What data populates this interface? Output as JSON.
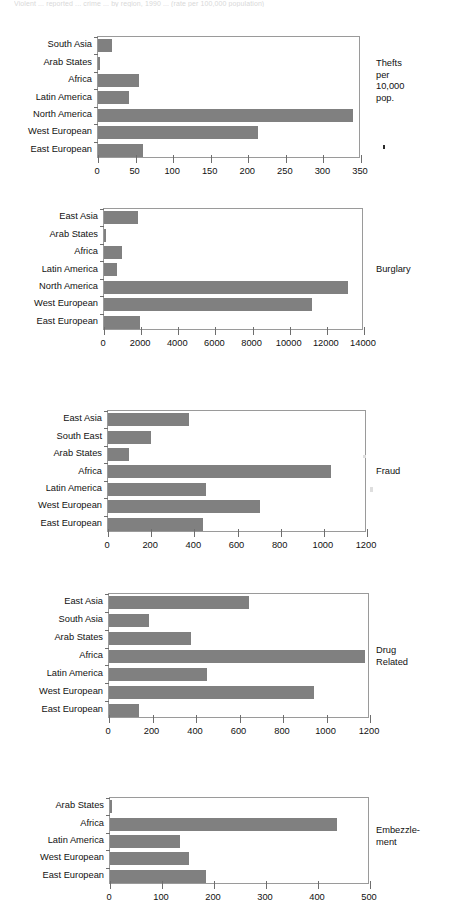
{
  "page": {
    "top_cropped_text": "Violent ... reported ... crime ... by region, 1990 ... (rate per 100,000 population)",
    "bar_color": "#808080",
    "axis_color": "#6e6e6e",
    "text_color": "#111111"
  },
  "chart_data": [
    {
      "type": "bar",
      "orientation": "horizontal",
      "title": "Thefts per 10,000 pop.",
      "side_label": "Thefts\nper\n10,000\npop.",
      "categories": [
        "South Asia",
        "Arab States",
        "Africa",
        "Latin America",
        "North America",
        "West European",
        "East European"
      ],
      "values": [
        18,
        1,
        55,
        41,
        339,
        213,
        60
      ],
      "xlabel": "",
      "ylabel": "",
      "xlim": [
        0,
        350
      ],
      "xticks": [
        0,
        50,
        100,
        150,
        200,
        250,
        300,
        350
      ],
      "xticklabels": [
        "0",
        "50",
        "100",
        "150",
        "200",
        "250",
        "300",
        "350"
      ],
      "grid": false,
      "legend": false
    },
    {
      "type": "bar",
      "orientation": "horizontal",
      "title": "Burglary",
      "side_label": "Burglary",
      "categories": [
        "East Asia",
        "Arab States",
        "Africa",
        "Latin America",
        "North America",
        "West European",
        "East European"
      ],
      "values": [
        1850,
        100,
        990,
        720,
        13150,
        11180,
        1920
      ],
      "xlabel": "",
      "ylabel": "",
      "xlim": [
        0,
        14000
      ],
      "xticks": [
        0,
        2000,
        4000,
        6000,
        8000,
        10000,
        12000,
        14000
      ],
      "xticklabels": [
        "0",
        "2000",
        "4000",
        "6000",
        "8000",
        "10000",
        "12000",
        "14000"
      ],
      "grid": false,
      "legend": false
    },
    {
      "type": "bar",
      "orientation": "horizontal",
      "title": "Fraud",
      "side_label": "Fraud",
      "categories": [
        "East Asia",
        "South East",
        "Arab States",
        "Africa",
        "Latin America",
        "West European",
        "East European"
      ],
      "values": [
        374,
        198,
        95,
        1035,
        453,
        703,
        441
      ],
      "xlabel": "",
      "ylabel": "",
      "xlim": [
        0,
        1200
      ],
      "xticks": [
        0,
        200,
        400,
        600,
        800,
        1000,
        1200
      ],
      "xticklabels": [
        "0",
        "200",
        "400",
        "600",
        "800",
        "1000",
        "1200"
      ],
      "grid": false,
      "legend": false
    },
    {
      "type": "bar",
      "orientation": "horizontal",
      "title": "Drug Related",
      "side_label": "Drug\nRelated",
      "categories": [
        "East Asia",
        "South Asia",
        "Arab States",
        "Africa",
        "Latin America",
        "West European",
        "East European"
      ],
      "values": [
        644,
        184,
        378,
        1177,
        449,
        943,
        138
      ],
      "xlabel": "",
      "ylabel": "",
      "xlim": [
        0,
        1200
      ],
      "xticks": [
        0,
        200,
        400,
        600,
        800,
        1000,
        1200
      ],
      "xticklabels": [
        "0",
        "200",
        "400",
        "600",
        "800",
        "1000",
        "1200"
      ],
      "grid": false,
      "legend": false
    },
    {
      "type": "bar",
      "orientation": "horizontal",
      "title": "Embezzlement",
      "side_label": "Embezzle-\nment",
      "categories": [
        "Arab States",
        "Africa",
        "Latin America",
        "West European",
        "East European"
      ],
      "values": [
        3,
        436,
        134,
        151,
        184
      ],
      "xlabel": "",
      "ylabel": "",
      "xlim": [
        0,
        500
      ],
      "xticks": [
        0,
        100,
        200,
        300,
        400,
        500
      ],
      "xticklabels": [
        "0",
        "100",
        "200",
        "300",
        "400",
        "500"
      ],
      "grid": false,
      "legend": false
    }
  ]
}
